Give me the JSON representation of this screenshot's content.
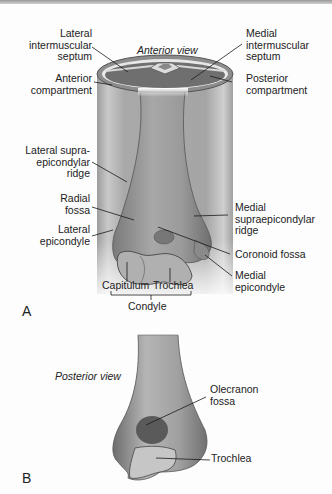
{
  "figure": {
    "panel_a": {
      "letter": "A",
      "view_title": "Anterior view",
      "labels": {
        "lateral_intermuscular_septum": "Lateral\nintermuscular\nseptum",
        "medial_intermuscular_septum": "Medial\nintermuscular\nseptum",
        "anterior_compartment": "Anterior\ncompartment",
        "posterior_compartment": "Posterior\ncompartment",
        "lateral_supraepicondylar_ridge": "Lateral supra-\nepicondylar\nridge",
        "radial_fossa": "Radial\nfossa",
        "lateral_epicondyle": "Lateral\nepicondyle",
        "medial_supraepicondylar_ridge": "Medial\nsupraepicondylar\nridge",
        "coronoid_fossa": "Coronoid fossa",
        "medial_epicondyle": "Medial\nepicondyle",
        "capitulum": "Capitulum",
        "trochlea": "Trochlea",
        "condyle": "Condyle"
      }
    },
    "panel_b": {
      "letter": "B",
      "view_title": "Posterior view",
      "labels": {
        "olecranon_fossa": "Olecranon\nfossa",
        "trochlea": "Trochlea"
      }
    }
  },
  "colors": {
    "compartment_fill": "#6f6f6f",
    "bone_fill": "#9a9a9a",
    "cylinder_fill": "#b8b8b8",
    "line": "#1a1a1a"
  }
}
